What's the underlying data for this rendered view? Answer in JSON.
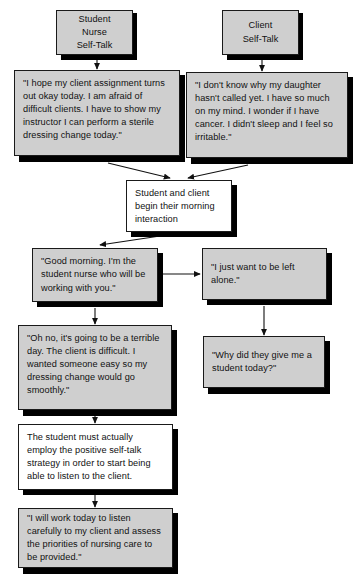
{
  "diagram": {
    "palette": {
      "node_fill_gray": "#cfcfcf",
      "node_fill_white": "#ffffff",
      "node_border": "#1a1a1a",
      "shadow": "#000000",
      "text": "#111111",
      "background": "#ffffff"
    },
    "nodes": [
      {
        "id": "student-nurse-header",
        "label": "Student Nurse\nSelf-Talk",
        "fill": "gray",
        "align": "center"
      },
      {
        "id": "client-header",
        "label": "Client\nSelf-Talk",
        "fill": "gray",
        "align": "center"
      },
      {
        "id": "nurse-self-talk-1",
        "label": "\"I hope my client assignment turns out okay today. I am afraid of difficult clients. I have to show my instructor I can perform a sterile dressing change today.\"",
        "fill": "gray",
        "align": "left"
      },
      {
        "id": "client-self-talk-1",
        "label": "\"I don't know why my daughter hasn't called yet. I have so much on my mind. I wonder if I have cancer. I didn't sleep and I feel so irritable.\"",
        "fill": "gray",
        "align": "left"
      },
      {
        "id": "interaction-begins",
        "label": "Student and client begin their morning interaction",
        "fill": "white",
        "align": "left"
      },
      {
        "id": "nurse-greeting",
        "label": "\"Good morning. I'm the student nurse who will be working with you.\"",
        "fill": "gray",
        "align": "left"
      },
      {
        "id": "client-response",
        "label": "\"I just want to be left alone.\"",
        "fill": "gray",
        "align": "left"
      },
      {
        "id": "nurse-self-talk-2",
        "label": "\"Oh no, it's going to be a terrible day. The client is difficult. I wanted someone easy so my dressing change would go smoothly.\"",
        "fill": "gray",
        "align": "left"
      },
      {
        "id": "client-self-talk-2",
        "label": "\"Why did they give me a student today?\"",
        "fill": "gray",
        "align": "left"
      },
      {
        "id": "strategy-note",
        "label": "The student must actually employ the positive self-talk strategy in order to start being able to listen to the client.",
        "fill": "white",
        "align": "left"
      },
      {
        "id": "nurse-positive-self-talk",
        "label": "\"I will work today to listen carefully to my client and assess the priorities of nursing care to be provided.\"",
        "fill": "gray",
        "align": "left"
      }
    ],
    "edges": [
      {
        "from": "student-nurse-header",
        "to": "nurse-self-talk-1",
        "style": "vertical-arrow"
      },
      {
        "from": "client-header",
        "to": "client-self-talk-1",
        "style": "vertical-arrow"
      },
      {
        "from": "nurse-self-talk-1",
        "to": "interaction-begins",
        "style": "diagonal-arrow"
      },
      {
        "from": "client-self-talk-1",
        "to": "interaction-begins",
        "style": "diagonal-arrow"
      },
      {
        "from": "interaction-begins",
        "to": "nurse-greeting",
        "style": "diagonal-arrow"
      },
      {
        "from": "nurse-greeting",
        "to": "client-response",
        "style": "horizontal-arrow"
      },
      {
        "from": "nurse-greeting",
        "to": "nurse-self-talk-2",
        "style": "vertical-arrow"
      },
      {
        "from": "client-response",
        "to": "client-self-talk-2",
        "style": "vertical-arrow"
      },
      {
        "from": "nurse-self-talk-2",
        "to": "strategy-note",
        "style": "vertical-arrow"
      },
      {
        "from": "strategy-note",
        "to": "nurse-positive-self-talk",
        "style": "vertical-arrow"
      }
    ]
  }
}
